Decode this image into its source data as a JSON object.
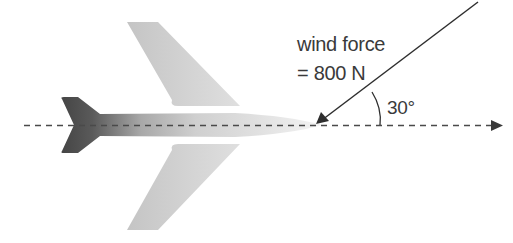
{
  "diagram": {
    "type": "force diagram",
    "labels": {
      "force_line1": "wind force",
      "force_line2": "= 800 N",
      "angle": "30°"
    },
    "force": {
      "name": "wind force",
      "magnitude": 800,
      "unit": "N",
      "angle_deg": 30,
      "angle_reference": "direction of travel (dashed centre line)"
    },
    "elements": [
      "aeroplane silhouette (grey gradient, dark tail to light nose)",
      "dashed centre line with arrowhead pointing right",
      "wind force arrow from upper right pointing to plane nose",
      "angle arc between force arrow and centre line"
    ],
    "colors": {
      "tail": "#4a4a4a",
      "body_light": "#e8e8e8",
      "line": "#444444",
      "text": "#3a3a3a"
    }
  }
}
